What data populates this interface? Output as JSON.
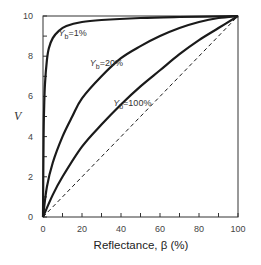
{
  "chart_data": {
    "type": "line",
    "title": "",
    "xlabel": "Reflectance, β (%)",
    "ylabel": "V",
    "xlim": [
      0,
      100
    ],
    "ylim": [
      0,
      10
    ],
    "xticks": [
      0,
      20,
      40,
      60,
      80,
      100
    ],
    "yticks": [
      0,
      2,
      4,
      6,
      8,
      10
    ],
    "grid": false,
    "legend": "inline curve labels",
    "series": [
      {
        "name": "Yb=1%",
        "label_main": "Y",
        "label_sub": "b",
        "label_rest": "=1%",
        "style": "solid",
        "x": [
          0,
          0.3,
          0.6,
          1,
          2,
          3,
          5,
          8,
          12,
          20,
          30,
          50,
          70,
          100
        ],
        "y": [
          0,
          4.0,
          5.5,
          6.6,
          7.8,
          8.4,
          8.9,
          9.25,
          9.5,
          9.7,
          9.8,
          9.9,
          9.95,
          10
        ]
      },
      {
        "name": "Yb=20%",
        "label_main": "Y",
        "label_sub": "b",
        "label_rest": "=20%",
        "style": "solid",
        "x": [
          0,
          2,
          5,
          10,
          15,
          20,
          30,
          40,
          50,
          60,
          70,
          80,
          90,
          100
        ],
        "y": [
          0,
          1.5,
          2.7,
          4.0,
          5.0,
          5.9,
          7.0,
          7.9,
          8.5,
          9.0,
          9.4,
          9.7,
          9.9,
          10
        ]
      },
      {
        "name": "Yb=100%",
        "label_main": "Y",
        "label_sub": "b",
        "label_rest": "=100%",
        "style": "solid",
        "x": [
          0,
          5,
          10,
          20,
          30,
          40,
          50,
          60,
          70,
          80,
          90,
          100
        ],
        "y": [
          0,
          1.1,
          2.0,
          3.5,
          4.6,
          5.6,
          6.5,
          7.3,
          8.1,
          8.8,
          9.4,
          10
        ]
      },
      {
        "name": "reference (linear)",
        "style": "dashed",
        "x": [
          0,
          100
        ],
        "y": [
          0,
          10
        ]
      }
    ],
    "annotations": [
      {
        "text": "Yb=1%",
        "x": 8,
        "y": 9.0
      },
      {
        "text": "Yb=20%",
        "x": 24,
        "y": 7.5
      },
      {
        "text": "Yb=100%",
        "x": 36,
        "y": 5.5
      }
    ]
  },
  "axes": {
    "xlabel": "Reflectance, β (%)",
    "ylabel": "V",
    "xtick_labels": [
      "0",
      "20",
      "40",
      "60",
      "80",
      "100"
    ],
    "ytick_labels": [
      "0",
      "2",
      "4",
      "6",
      "8",
      "10"
    ]
  },
  "colors": {
    "line": "#1a1a1a",
    "axis": "#333333",
    "text": "#333333"
  }
}
